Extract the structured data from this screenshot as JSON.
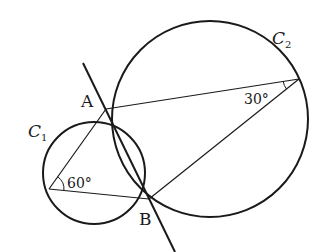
{
  "diagram": {
    "type": "geometry",
    "colors": {
      "stroke": "#1a1a1a",
      "background": "#ffffff"
    },
    "circles": [
      {
        "id": "C1",
        "label": "C",
        "subscript": "1",
        "cx": 94,
        "cy": 173,
        "r": 51
      },
      {
        "id": "C2",
        "label": "C",
        "subscript": "2",
        "cx": 210,
        "cy": 119,
        "r": 98
      }
    ],
    "points": [
      {
        "id": "A",
        "label": "A",
        "x": 106,
        "y": 109
      },
      {
        "id": "B",
        "label": "B",
        "x": 149,
        "y": 199
      },
      {
        "id": "P",
        "label": "",
        "x": 49,
        "y": 189
      },
      {
        "id": "Q",
        "label": "",
        "x": 299,
        "y": 79
      }
    ],
    "angles": [
      {
        "vertex": "P",
        "label": "60°",
        "value": 60
      },
      {
        "vertex": "Q",
        "label": "30°",
        "value": 30
      }
    ],
    "segments": [
      [
        "P",
        "A"
      ],
      [
        "P",
        "B"
      ],
      [
        "Q",
        "A"
      ],
      [
        "Q",
        "B"
      ]
    ],
    "line": {
      "through": [
        "A",
        "B"
      ],
      "from": [
        83,
        63
      ],
      "to": [
        175,
        252
      ]
    }
  },
  "labels": {
    "A": "A",
    "B": "B",
    "C1_main": "C",
    "C1_sub": "1",
    "C2_main": "C",
    "C2_sub": "2",
    "angle_60": "60°",
    "angle_30": "30°"
  }
}
